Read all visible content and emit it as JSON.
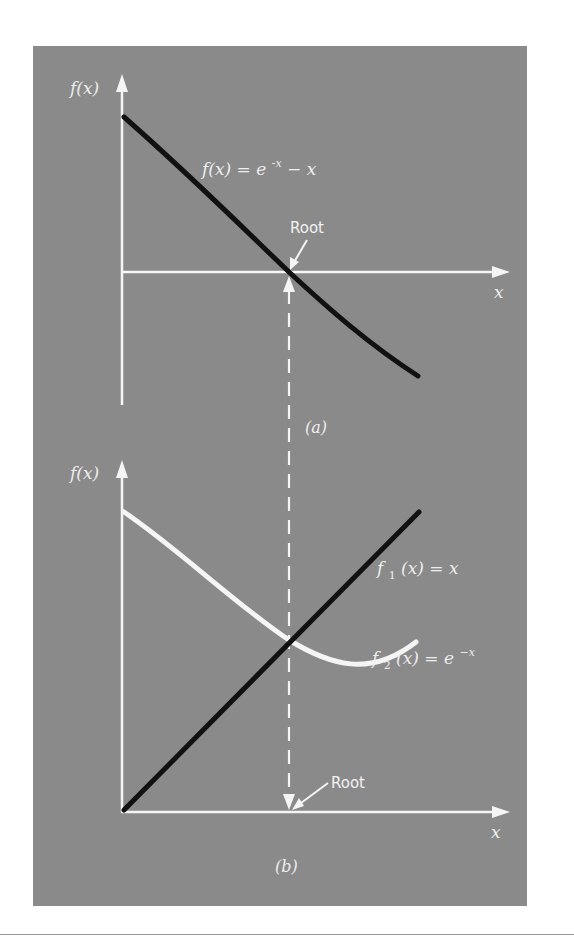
{
  "figure": {
    "background_color": "#8a8a8a",
    "axis_color": "#f5f5f5",
    "dark_curve_color": "#111111",
    "light_curve_color": "#f5f5f5"
  },
  "panel_a": {
    "caption": "(a)",
    "y_axis_label": "f(x)",
    "x_axis_label": "x",
    "curve_label": "f(x) = e^-x - x",
    "curve_label_parts": {
      "lhs": "f(x) = e",
      "exponent": "-x",
      "rhs": " − x"
    },
    "root_label": "Root"
  },
  "panel_b": {
    "caption": "(b)",
    "y_axis_label": "f(x)",
    "x_axis_label": "x",
    "f1_label": {
      "name": "f",
      "sub": "1",
      "rest": "(x) = x"
    },
    "f2_label": {
      "name": "f",
      "sub": "2",
      "rest": "(x) = e",
      "exponent": "−x"
    },
    "root_label": "Root"
  }
}
